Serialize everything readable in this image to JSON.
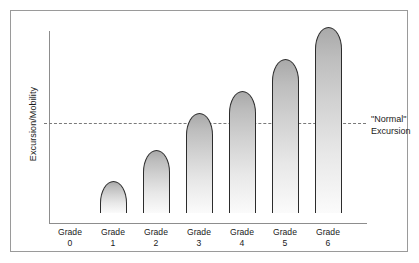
{
  "figure": {
    "type": "bar-chart-illustration",
    "background_color": "#ffffff",
    "frame_color": "#9a9a9a",
    "axis_color": "#8d8d8d",
    "bar_outline_color": "#2c2c2c",
    "bar_fill_top": "#a9a9a9",
    "bar_fill_bottom": "#fbfbfb",
    "reference_line_color": "#7a7a7a"
  },
  "axes": {
    "y_label": "Excursion/Mobility",
    "x_labels": [
      {
        "line1": "Grade",
        "line2": "0"
      },
      {
        "line1": "Grade",
        "line2": "1"
      },
      {
        "line1": "Grade",
        "line2": "2"
      },
      {
        "line1": "Grade",
        "line2": "3"
      },
      {
        "line1": "Grade",
        "line2": "4"
      },
      {
        "line1": "Grade",
        "line2": "5"
      },
      {
        "line1": "Grade",
        "line2": "6"
      }
    ]
  },
  "annotation": {
    "normal_line_label_1": "\"Normal\"",
    "normal_line_label_2": "Excursion"
  },
  "chart_data": {
    "type": "bar",
    "title": "",
    "xlabel": "",
    "ylabel": "Excursion/Mobility",
    "categories": [
      "Grade 0",
      "Grade 1",
      "Grade 2",
      "Grade 3",
      "Grade 4",
      "Grade 5",
      "Grade 6"
    ],
    "values": [
      0,
      32,
      63,
      100,
      122,
      154,
      186
    ],
    "value_units": "relative excursion (pixels above baseline)",
    "ylim": [
      0,
      200
    ],
    "grid": false,
    "legend": false,
    "reference_lines": [
      {
        "label": "\"Normal\" Excursion",
        "value": 100,
        "style": "dashed",
        "orientation": "horizontal"
      }
    ]
  }
}
